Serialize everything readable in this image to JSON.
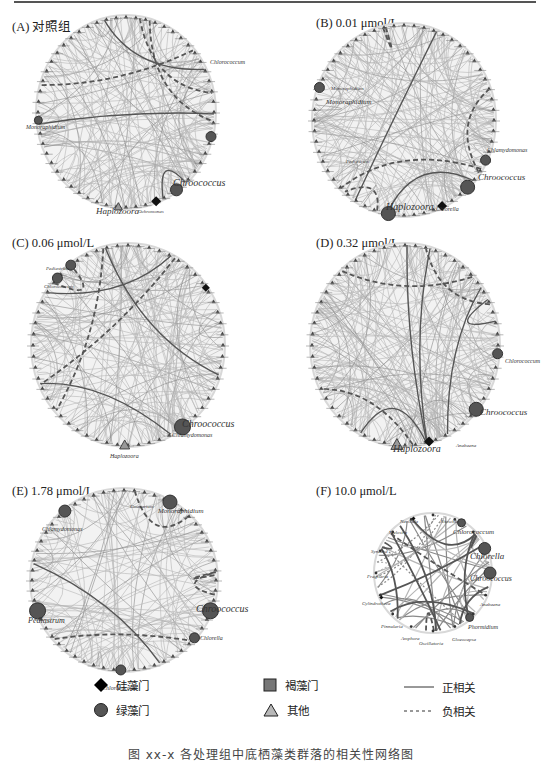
{
  "page": {
    "caption": "图 xx-x  各处理组中底栖藻类群落的相关性网络图"
  },
  "panels": [
    {
      "id": "A",
      "label": "(A) 对照组",
      "label_pos": [
        12,
        16
      ],
      "center": [
        126,
        112
      ],
      "radius": [
        88,
        95
      ],
      "density": 170,
      "dashed": 3,
      "heavy": 3,
      "nodes": [
        {
          "name": "Chlorococcum",
          "angle": 15,
          "size": 5,
          "shape": "circle"
        },
        {
          "name": "Monoraphidium",
          "angle": 175,
          "size": 4,
          "shape": "circle"
        },
        {
          "name": "Chroococcus",
          "angle": 55,
          "size": 5,
          "shape": "circle",
          "big": true
        },
        {
          "name": "Haplozoora",
          "angle": 95,
          "size": 4,
          "shape": "triangle"
        },
        {
          "name": "Diatoma",
          "angle": 70,
          "size": 5,
          "shape": "diamond"
        }
      ],
      "texts": [
        {
          "t": "Chlorococcum",
          "x": 210,
          "y": 64,
          "s": 6
        },
        {
          "t": "Monoraphidium",
          "x": 26,
          "y": 129,
          "s": 6
        },
        {
          "t": "Chroococcus",
          "x": 173,
          "y": 186,
          "s": 10
        },
        {
          "t": "Haplozoora",
          "x": 96,
          "y": 214,
          "s": 9
        },
        {
          "t": "Ochromonas",
          "x": 138,
          "y": 213,
          "s": 5
        }
      ]
    },
    {
      "id": "B",
      "label": "(B) 0.01 μmol/L",
      "label_pos": [
        316,
        16
      ],
      "center": [
        404,
        120
      ],
      "radius": [
        90,
        95
      ],
      "density": 180,
      "dashed": 4,
      "heavy": 2,
      "nodes": [
        {
          "name": "Chlamydomonas",
          "angle": 25,
          "size": 5,
          "shape": "circle"
        },
        {
          "name": "Chroococcus",
          "angle": 45,
          "size": 6,
          "shape": "circle",
          "big": true
        },
        {
          "name": "Monoraphidium",
          "angle": 200,
          "size": 5,
          "shape": "circle"
        },
        {
          "name": "Haplozoora",
          "angle": 100,
          "size": 6,
          "shape": "circle",
          "big": true
        },
        {
          "name": "Diatoma",
          "angle": 65,
          "size": 5,
          "shape": "diamond"
        }
      ],
      "texts": [
        {
          "t": "Monoraphidium",
          "x": 331,
          "y": 90,
          "s": 5
        },
        {
          "t": "Monoraphidium",
          "x": 326,
          "y": 104,
          "s": 7
        },
        {
          "t": "Chlamydomonas",
          "x": 487,
          "y": 152,
          "s": 6
        },
        {
          "t": "Chroococcus",
          "x": 478,
          "y": 180,
          "s": 9
        },
        {
          "t": "Haplozoora",
          "x": 386,
          "y": 210,
          "s": 10
        },
        {
          "t": "Chlorella",
          "x": 436,
          "y": 211,
          "s": 6
        },
        {
          "t": "Pediastrum",
          "x": 346,
          "y": 163,
          "s": 5
        }
      ]
    },
    {
      "id": "C",
      "label": "(C) 0.06 μmol/L",
      "label_pos": [
        12,
        236
      ],
      "center": [
        128,
        345
      ],
      "radius": [
        95,
        100
      ],
      "density": 180,
      "dashed": 3,
      "heavy": 3,
      "nodes": [
        {
          "name": "Chroococcus",
          "angle": 55,
          "size": 7,
          "shape": "circle",
          "big": true
        },
        {
          "name": "Pediastrum",
          "angle": 233,
          "size": 5,
          "shape": "circle"
        },
        {
          "name": "Chlorococcum",
          "angle": 222,
          "size": 5,
          "shape": "circle"
        },
        {
          "name": "Haplozoora",
          "angle": 92,
          "size": 5,
          "shape": "triangle"
        },
        {
          "name": "Cyclotella",
          "angle": 325,
          "size": 4,
          "shape": "diamond"
        }
      ],
      "texts": [
        {
          "t": "Chroococcus",
          "x": 182,
          "y": 427,
          "s": 10
        },
        {
          "t": "Chlamydomonas",
          "x": 172,
          "y": 437,
          "s": 6
        },
        {
          "t": "Haplozoora",
          "x": 110,
          "y": 458,
          "s": 6
        },
        {
          "t": "Pediastrum",
          "x": 46,
          "y": 270,
          "s": 5
        },
        {
          "t": "Chlorococcum",
          "x": 44,
          "y": 288,
          "s": 5
        }
      ]
    },
    {
      "id": "D",
      "label": "(D) 0.32 μmol/L",
      "label_pos": [
        316,
        236
      ],
      "center": [
        405,
        345
      ],
      "radius": [
        93,
        100
      ],
      "density": 200,
      "dashed": 3,
      "heavy": 5,
      "nodes": [
        {
          "name": "Chroococcus",
          "angle": 40,
          "size": 6,
          "shape": "circle",
          "big": true
        },
        {
          "name": "Haplozoora",
          "angle": 95,
          "size": 6,
          "shape": "triangle"
        },
        {
          "name": "Chlorococcum",
          "angle": 5,
          "size": 5,
          "shape": "circle"
        },
        {
          "name": "Diatoma",
          "angle": 75,
          "size": 5,
          "shape": "diamond"
        }
      ],
      "texts": [
        {
          "t": "Chlorococcum",
          "x": 505,
          "y": 363,
          "s": 6
        },
        {
          "t": "Chroococcus",
          "x": 480,
          "y": 415,
          "s": 9
        },
        {
          "t": "Haplozoora",
          "x": 393,
          "y": 452,
          "s": 10
        },
        {
          "t": "Anabaena",
          "x": 456,
          "y": 447,
          "s": 5
        }
      ]
    },
    {
      "id": "E",
      "label": "(E) 1.78 μmol/L",
      "label_pos": [
        12,
        484
      ],
      "center": [
        124,
        580
      ],
      "radius": [
        92,
        90
      ],
      "density": 130,
      "dashed": 4,
      "heavy": 1,
      "nodes": [
        {
          "name": "Monoraphidium",
          "angle": 300,
          "size": 6,
          "shape": "circle",
          "big": true
        },
        {
          "name": "Chlamydomonas",
          "angle": 230,
          "size": 6,
          "shape": "circle"
        },
        {
          "name": "Chroococcus",
          "angle": 20,
          "size": 7,
          "shape": "circle",
          "big": true
        },
        {
          "name": "Pediastrum",
          "angle": 160,
          "size": 7,
          "shape": "circle",
          "big": true
        },
        {
          "name": "Chlorella",
          "angle": 40,
          "size": 5,
          "shape": "circle"
        },
        {
          "name": "Chlorococcum",
          "angle": 92,
          "size": 5,
          "shape": "circle"
        }
      ],
      "texts": [
        {
          "t": "Monoraphidium",
          "x": 158,
          "y": 513,
          "s": 7
        },
        {
          "t": "Chlamydomonas",
          "x": 42,
          "y": 531,
          "s": 6
        },
        {
          "t": "Chroococcus",
          "x": 196,
          "y": 612,
          "s": 10
        },
        {
          "t": "Pediastrum",
          "x": 28,
          "y": 623,
          "s": 8
        },
        {
          "t": "Chlorella",
          "x": 200,
          "y": 640,
          "s": 6
        },
        {
          "t": "Chlorococcum",
          "x": 102,
          "y": 690,
          "s": 6
        },
        {
          "t": "Cosmarium",
          "x": 130,
          "y": 508,
          "s": 5
        }
      ]
    },
    {
      "id": "F",
      "label": "(F) 10.0 μmol/L",
      "label_pos": [
        316,
        484
      ],
      "center": [
        433,
        573
      ],
      "radius": [
        57,
        58
      ],
      "density": 36,
      "dashed": 2,
      "heavy": 10,
      "sparse": true,
      "nodes": [
        {
          "name": "Chlorococcum",
          "angle": 300,
          "size": 4,
          "shape": "circle"
        },
        {
          "name": "Chlorella",
          "angle": 335,
          "size": 5,
          "shape": "circle",
          "big": true
        },
        {
          "name": "Chroococcus",
          "angle": 0,
          "size": 5,
          "shape": "circle",
          "big": true
        },
        {
          "name": "Phormidium",
          "angle": 50,
          "size": 4,
          "shape": "circle"
        },
        {
          "name": "Cylindrotheca",
          "angle": 155,
          "size": 2,
          "shape": "diamond"
        },
        {
          "name": "Navicula",
          "angle": 250,
          "size": 2,
          "shape": "diamond"
        }
      ],
      "texts": [
        {
          "t": "Navicula",
          "x": 400,
          "y": 523,
          "s": 5
        },
        {
          "t": "Nitzschia",
          "x": 440,
          "y": 523,
          "s": 5
        },
        {
          "t": "Chlorococcum",
          "x": 453,
          "y": 534,
          "s": 7
        },
        {
          "t": "Melosira",
          "x": 389,
          "y": 534,
          "s": 5
        },
        {
          "t": "Synedra",
          "x": 371,
          "y": 553,
          "s": 5
        },
        {
          "t": "Chlorella",
          "x": 470,
          "y": 559,
          "s": 9
        },
        {
          "t": "Fragilaria",
          "x": 367,
          "y": 578,
          "s": 5
        },
        {
          "t": "Chroococcus",
          "x": 470,
          "y": 581,
          "s": 8
        },
        {
          "t": "Cylindrotheca",
          "x": 362,
          "y": 605,
          "s": 5
        },
        {
          "t": "Anabaena",
          "x": 480,
          "y": 606,
          "s": 5
        },
        {
          "t": "Pinnularia",
          "x": 381,
          "y": 628,
          "s": 5
        },
        {
          "t": "Phormidium",
          "x": 468,
          "y": 629,
          "s": 6
        },
        {
          "t": "Amphora",
          "x": 401,
          "y": 640,
          "s": 5
        },
        {
          "t": "Oscillatoria",
          "x": 419,
          "y": 645,
          "s": 5
        },
        {
          "t": "Gloeocapsa",
          "x": 452,
          "y": 641,
          "s": 5
        }
      ]
    }
  ],
  "legend": {
    "phylum": [
      {
        "symbol": "diamond",
        "label": "硅藻门",
        "color": "#000000"
      },
      {
        "symbol": "circle",
        "label": "绿藻门",
        "color": "#555555"
      },
      {
        "symbol": "square",
        "label": "褐藻门",
        "color": "#777777"
      },
      {
        "symbol": "triangle",
        "label": "其他",
        "color": "#b8b8b8"
      }
    ],
    "edges": [
      {
        "style": "solid",
        "label": "正相关"
      },
      {
        "style": "dashed",
        "label": "负相关"
      }
    ]
  },
  "colors": {
    "edge_light": "#b5b5b5",
    "edge_mid": "#8a8a8a",
    "edge_dark": "#555555",
    "node_dark": "#3a3a3a",
    "ring": "#d8d8d8"
  }
}
